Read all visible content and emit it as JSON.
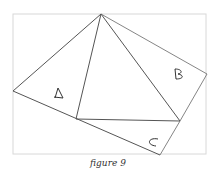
{
  "figure": {
    "caption": "figure 9",
    "labels": {
      "a": "A",
      "b": "B",
      "c": "C"
    },
    "colors": {
      "frame": "#d8d8d8",
      "lines": "#555555",
      "text": "#333333"
    }
  }
}
